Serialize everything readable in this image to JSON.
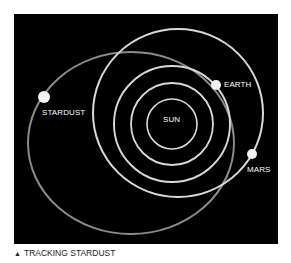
{
  "diagram": {
    "title_caption": "TRACKING STARDUST",
    "caption_icon": "triangle-up-icon",
    "background": "#000000",
    "bodies": {
      "sun": {
        "label": "SUN"
      },
      "earth": {
        "label": "EARTH"
      },
      "mars": {
        "label": "MARS"
      },
      "stardust": {
        "label": "STARDUST"
      }
    },
    "colors": {
      "orbit": "#d9d9d9",
      "stardust_orbit": "#8a8a8a",
      "planet": "#f2f2f2",
      "text": "#ffffff"
    }
  }
}
